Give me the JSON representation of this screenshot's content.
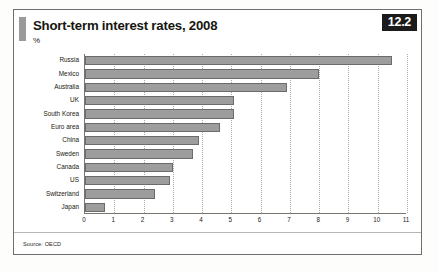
{
  "figure": {
    "title": "Short-term interest rates, 2008",
    "subtitle": "%",
    "badge": "12.2",
    "source": "Source: OECD"
  },
  "chart_data": {
    "type": "bar",
    "orientation": "horizontal",
    "title": "Short-term interest rates, 2008",
    "xlabel": "",
    "ylabel": "",
    "unit": "%",
    "xlim": [
      0,
      11
    ],
    "xticks": [
      0,
      1,
      2,
      3,
      4,
      5,
      6,
      7,
      8,
      9,
      10,
      11
    ],
    "grid": "vertical-dotted",
    "legend": "none",
    "bar_color": "#9d9d9d",
    "categories": [
      "Russia",
      "Mexico",
      "Australia",
      "UK",
      "South Korea",
      "Euro area",
      "China",
      "Sweden",
      "Canada",
      "US",
      "Switzerland",
      "Japan"
    ],
    "values": [
      10.5,
      8.0,
      6.9,
      5.1,
      5.1,
      4.6,
      3.9,
      3.7,
      3.0,
      2.9,
      2.4,
      0.7
    ]
  }
}
